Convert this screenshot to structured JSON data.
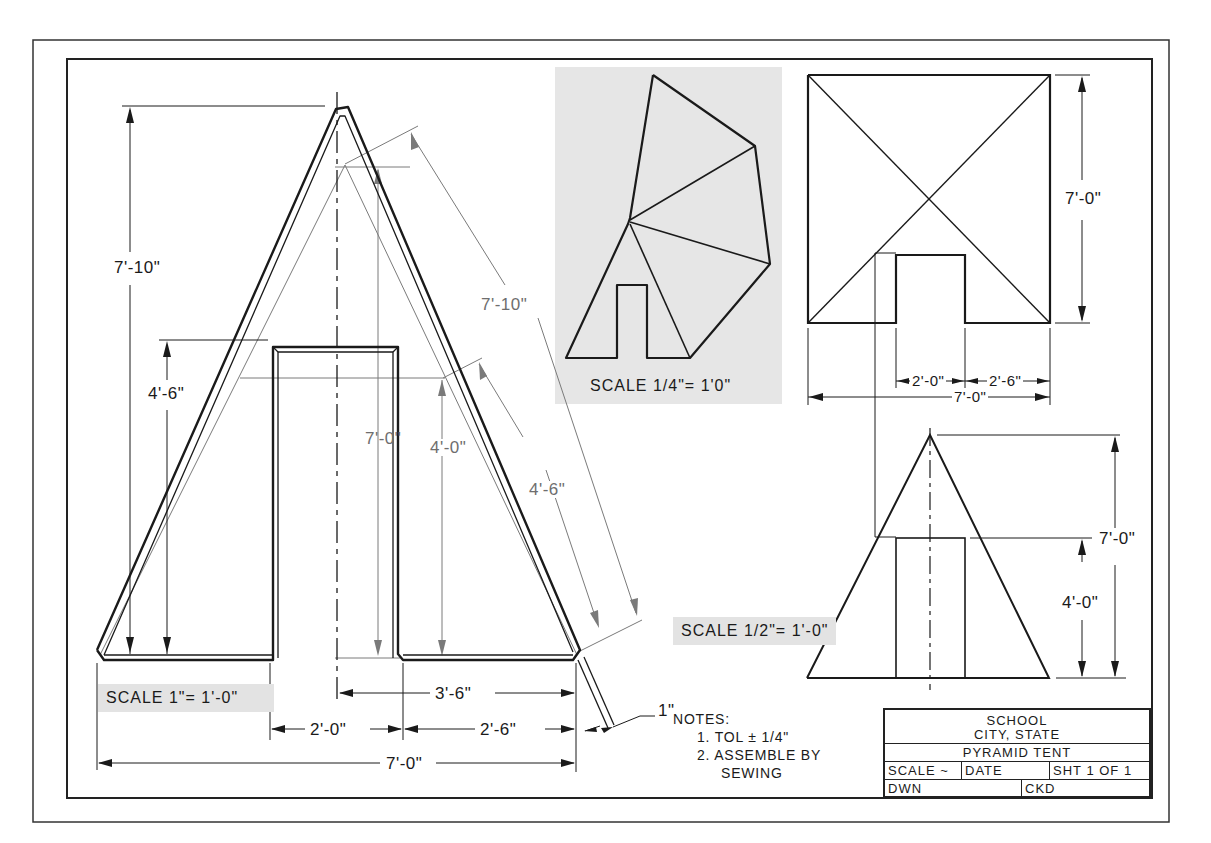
{
  "title_block": {
    "school": "SCHOOL",
    "location": "CITY, STATE",
    "drawing_title": "PYRAMID TENT",
    "scale_label": "SCALE ~",
    "date_label": "DATE",
    "sheet_label": "SHT 1 OF 1",
    "drawn_label": "DWN",
    "checked_label": "CKD"
  },
  "notes": {
    "heading": "NOTES:",
    "items": [
      "1. TOL ± 1/4\"",
      "2. ASSEMBLE BY",
      "SEWING"
    ]
  },
  "main_view": {
    "scale": "SCALE 1\"= 1'-0\"",
    "dims": {
      "total_height": "7'-10\"",
      "door_height": "4'-6\"",
      "slant_length": "7'-10\"",
      "inner_height": "7'-0\"",
      "door_inner_height": "4'-0\"",
      "slant_door": "4'-6\"",
      "half_base": "3'-6\"",
      "door_width": "2'-0\"",
      "side_width": "2'-6\"",
      "base_width": "7'-0\"",
      "seam_allowance": "1\""
    }
  },
  "pattern_view": {
    "scale": "SCALE 1/4\"= 1'0\""
  },
  "top_view": {
    "dims": {
      "depth": "7'-0\"",
      "door_width": "2'-0\"",
      "side_width": "2'-6\"",
      "width": "7'-0\""
    }
  },
  "front_view": {
    "scale": "SCALE 1/2\"= 1'-0\"",
    "dims": {
      "height": "7'-0\"",
      "door_height": "4'-0\""
    }
  },
  "colors": {
    "line": "#1a1a1a",
    "dim_line": "#6e6e6e",
    "scale_bg": "#e3e3e3",
    "pattern_bg": "#e6e6e6"
  }
}
